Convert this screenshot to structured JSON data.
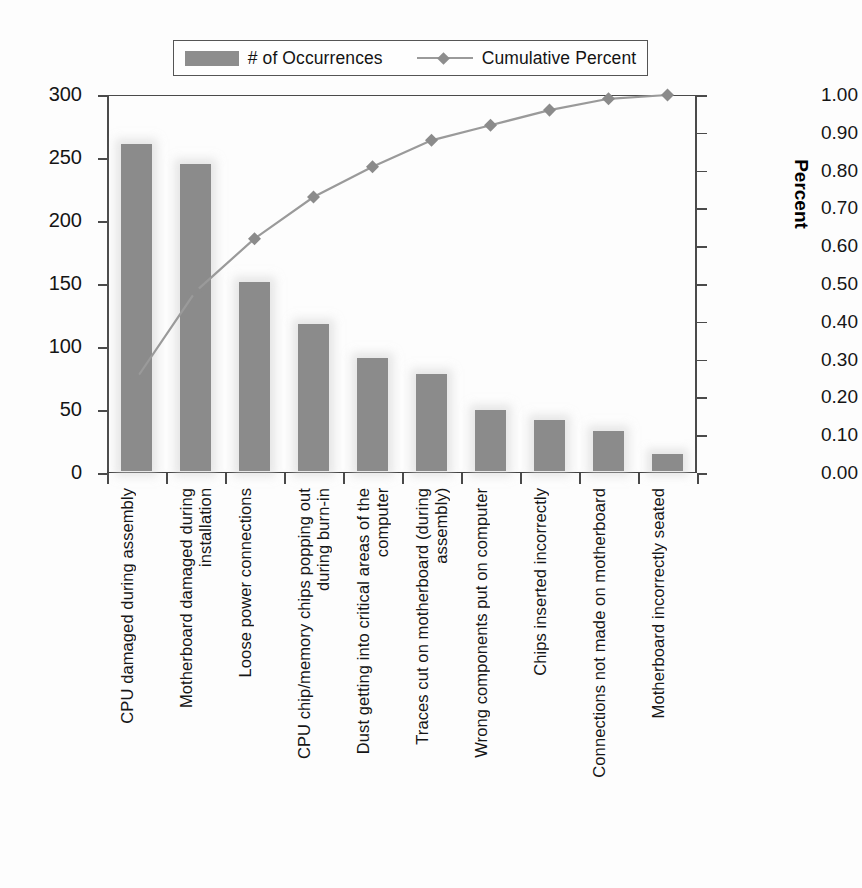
{
  "chart_data": {
    "type": "bar",
    "title": "",
    "subtitle": "",
    "xlabel": "",
    "ylabel": "Defects",
    "y2label": "Percent",
    "ylim": [
      0,
      300
    ],
    "y2lim": [
      0,
      1.0
    ],
    "grid": false,
    "legend_position": "top-center",
    "categories": [
      "CPU damaged during assembly",
      "Motherboard damaged during\ninstallation",
      "Loose power connections",
      "CPU chip/memory chips popping out\nduring burn-in",
      "Dust getting into critical areas of the\ncomputer",
      "Traces cut on motherboard (during\nassembly)",
      "Wrong components put on computer",
      "Chips inserted incorrectly",
      "Connections not made on motherboard",
      "Motherboard incorrectly seated"
    ],
    "series": [
      {
        "name": "# of Occurrences",
        "type": "bar",
        "axis": "left",
        "color": "#8b8b8b",
        "values": [
          260,
          244,
          150,
          117,
          90,
          77,
          49,
          41,
          32,
          14
        ]
      },
      {
        "name": "Cumulative Percent",
        "type": "line",
        "axis": "right",
        "color": "#9a9a9a",
        "marker": "diamond",
        "values": [
          0.25,
          0.48,
          0.62,
          0.73,
          0.81,
          0.88,
          0.92,
          0.96,
          0.99,
          1.0
        ]
      }
    ],
    "y_ticks": [
      0,
      50,
      100,
      150,
      200,
      250,
      300
    ],
    "y_tick_labels": [
      "0",
      "50",
      "100",
      "150",
      "200",
      "250",
      "300"
    ],
    "y2_ticks": [
      0.0,
      0.1,
      0.2,
      0.3,
      0.4,
      0.5,
      0.6,
      0.7,
      0.8,
      0.9,
      1.0
    ],
    "y2_tick_labels": [
      "0.00",
      "0.10",
      "0.20",
      "0.30",
      "0.40",
      "0.50",
      "0.60",
      "0.70",
      "0.80",
      "0.90",
      "1.00"
    ]
  },
  "legend": {
    "bar_label": "# of Occurrences",
    "line_label": "Cumulative Percent"
  }
}
